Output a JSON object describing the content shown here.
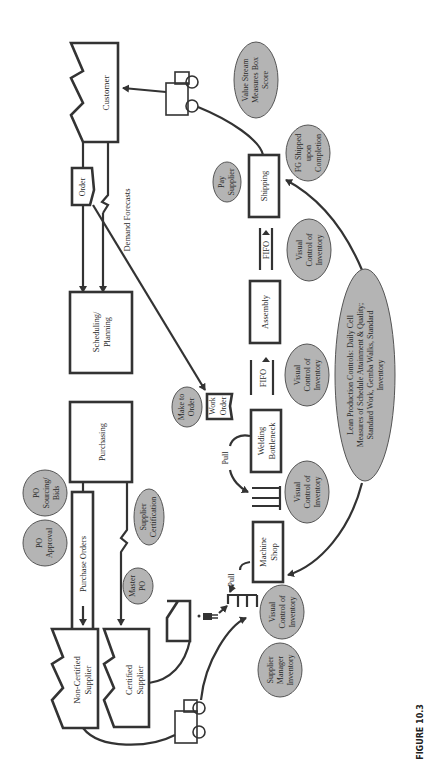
{
  "figure": {
    "caption": "FIGURE 10.3",
    "orientation": "rotated 90 degrees counter-clockwise"
  },
  "colors": {
    "line": "#333333",
    "oval_fill": "#b4b4b4",
    "background": "#ffffff"
  },
  "entities": {
    "customer": "Customer",
    "order": "Order",
    "demand_forecasts": "Demand Forecasts",
    "scheduling": [
      "Scheduling/",
      "Planning"
    ],
    "purchasing": "Purchasing",
    "purchase_orders": "Purchase Orders",
    "non_certified_supplier": [
      "Non-Certified",
      "Supplier"
    ],
    "certified_supplier": [
      "Certified",
      "Supplier"
    ],
    "shipping": "Shipping",
    "assembly": "Assembly",
    "welding": [
      "Welding",
      "Bottleneck"
    ],
    "machine_shop": [
      "Machine",
      "Shop"
    ],
    "work_order": [
      "Work",
      "Order"
    ],
    "fifo_1": "FIFO",
    "fifo_2": "FIFO",
    "pull_1": "Pull",
    "pull_2": "Pull"
  },
  "ovals": {
    "value_stream": [
      "Value Stream",
      "Measures Box",
      "Score"
    ],
    "fg_shipped": [
      "FG Shipped",
      "upon",
      "Completion"
    ],
    "pay_supplier": [
      "Pay",
      "Supplier"
    ],
    "visual_1": [
      "Visual",
      "Control of",
      "Inventory"
    ],
    "visual_2": [
      "Visual",
      "Control of",
      "Inventory"
    ],
    "visual_3": [
      "Visual",
      "Control of",
      "Inventory"
    ],
    "visual_4": [
      "Visual",
      "Control of",
      "Inventory"
    ],
    "make_to_order": [
      "Make to",
      "Order"
    ],
    "po_sourcing": [
      "PO",
      "Sourcing/",
      "Bids"
    ],
    "po_approval": [
      "PO",
      "Approval"
    ],
    "supplier_cert": [
      "Supplier",
      "Certification"
    ],
    "master_po": [
      "Master",
      "PO"
    ],
    "supplier_managed": [
      "Supplier",
      "Manager",
      "Inventory"
    ],
    "lean_controls": [
      "Lean Production Controls: Daily Cell",
      "Measures of Schedule Attainment & Quality;",
      "Standard Work, Gemba Walks, Standard",
      "Inventory"
    ]
  }
}
